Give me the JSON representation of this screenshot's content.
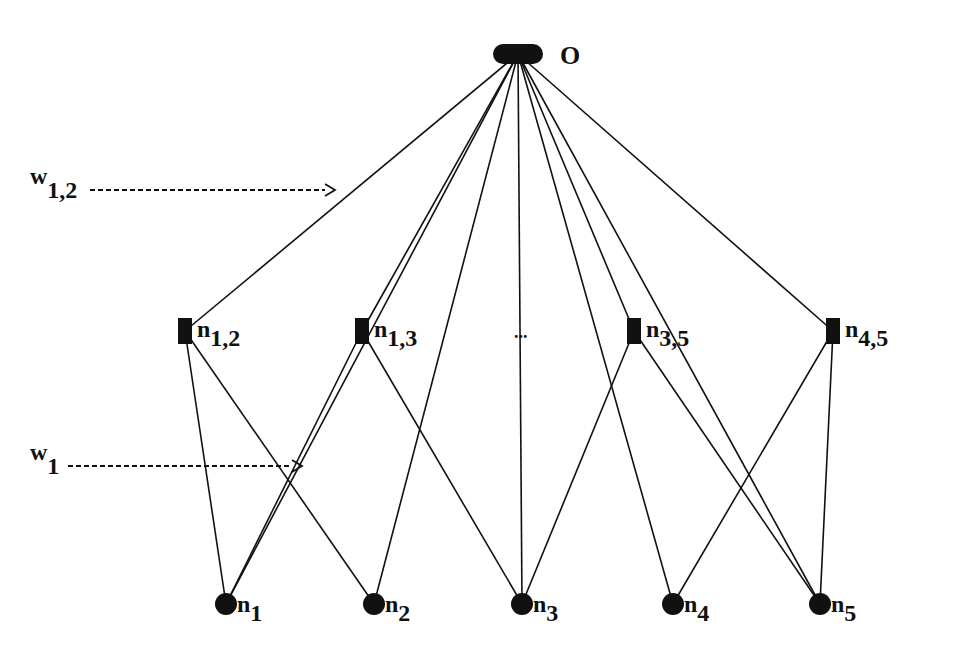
{
  "diagram": {
    "type": "network",
    "output_node": {
      "id": "O",
      "label": "O",
      "x": 518,
      "y": 54
    },
    "pair_nodes": [
      {
        "id": "n12",
        "base": "n",
        "sub": "1,2",
        "x": 185,
        "y": 331
      },
      {
        "id": "n13",
        "base": "n",
        "sub": "1,3",
        "x": 362,
        "y": 331
      },
      {
        "id": "n35",
        "base": "n",
        "sub": "3,5",
        "x": 634,
        "y": 331
      },
      {
        "id": "n45",
        "base": "n",
        "sub": "4,5",
        "x": 833,
        "y": 331
      }
    ],
    "ellipsis": {
      "label": "...",
      "x": 524,
      "y": 338
    },
    "input_nodes": [
      {
        "id": "n1",
        "base": "n",
        "sub": "1",
        "x": 226,
        "y": 604
      },
      {
        "id": "n2",
        "base": "n",
        "sub": "2",
        "x": 374,
        "y": 604
      },
      {
        "id": "n3",
        "base": "n",
        "sub": "3",
        "x": 522,
        "y": 604
      },
      {
        "id": "n4",
        "base": "n",
        "sub": "4",
        "x": 673,
        "y": 604
      },
      {
        "id": "n5",
        "base": "n",
        "sub": "5",
        "x": 820,
        "y": 604
      }
    ],
    "edges": [
      [
        "O",
        "n12"
      ],
      [
        "O",
        "n13"
      ],
      [
        "O",
        "n1"
      ],
      [
        "O",
        "n2"
      ],
      [
        "O",
        "n3"
      ],
      [
        "O",
        "n4"
      ],
      [
        "O",
        "n35"
      ],
      [
        "O",
        "n5"
      ],
      [
        "O",
        "n45"
      ],
      [
        "n12",
        "n1"
      ],
      [
        "n12",
        "n2"
      ],
      [
        "n13",
        "n1"
      ],
      [
        "n13",
        "n3"
      ],
      [
        "n35",
        "n3"
      ],
      [
        "n35",
        "n5"
      ],
      [
        "n45",
        "n4"
      ],
      [
        "n45",
        "n5"
      ]
    ],
    "annotations": [
      {
        "id": "w12",
        "base": "w",
        "sub": "1,2",
        "x": 30,
        "y": 190,
        "arrow_to_x": 335,
        "arrow_y": 190
      },
      {
        "id": "w1",
        "base": "w",
        "sub": "1",
        "x": 30,
        "y": 466,
        "arrow_to_x": 302,
        "arrow_y": 466
      }
    ],
    "colors": {
      "ink": "#111111",
      "background": "#ffffff"
    }
  }
}
